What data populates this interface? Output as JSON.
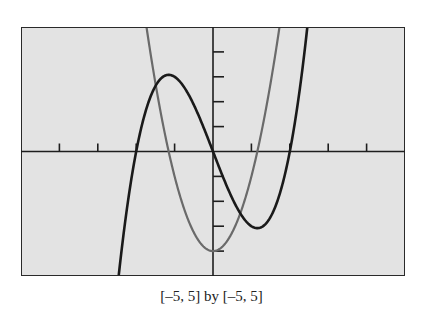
{
  "chart_data": {
    "type": "line",
    "title": "",
    "caption": "[–5, 5] by [–5, 5]",
    "xlabel": "",
    "ylabel": "",
    "xlim": [
      -5,
      5
    ],
    "ylim": [
      -5,
      5
    ],
    "xscl": 1,
    "yscl": 1,
    "grid": false,
    "legend": null,
    "background": "#e3e3e3",
    "series": [
      {
        "name": "f(x) = x^3 - 4x",
        "color": "#1a1a1a",
        "stroke_width": 2.6,
        "x": [
          -2.46,
          -2.25,
          -2,
          -1.75,
          -1.5,
          -1.155,
          -1,
          -0.75,
          -0.5,
          -0.25,
          0,
          0.25,
          0.5,
          0.75,
          1,
          1.155,
          1.5,
          1.75,
          2,
          2.25,
          2.46
        ],
        "values": [
          -5.05,
          -2.39,
          0,
          1.64,
          2.63,
          3.08,
          3,
          2.58,
          1.88,
          0.98,
          0,
          -0.98,
          -1.88,
          -2.58,
          -3,
          -3.08,
          -2.63,
          -1.64,
          0,
          2.39,
          5.05
        ]
      },
      {
        "name": "f'(x) = 3x^2 - 4",
        "color": "#6a6a6a",
        "stroke_width": 2.2,
        "x": [
          -1.732,
          -1.5,
          -1.25,
          -1.155,
          -1,
          -0.75,
          -0.5,
          -0.25,
          0,
          0.25,
          0.5,
          0.75,
          1,
          1.155,
          1.25,
          1.5,
          1.732
        ],
        "values": [
          5,
          2.75,
          0.69,
          0,
          -1,
          -2.31,
          -3.25,
          -3.81,
          -4,
          -3.81,
          -3.25,
          -2.31,
          -1,
          0,
          0.69,
          2.75,
          5
        ]
      }
    ],
    "key_points": {
      "cubic_roots": [
        -2,
        0,
        2
      ],
      "cubic_local_max": [
        -1.155,
        3.08
      ],
      "cubic_local_min": [
        1.155,
        -3.08
      ],
      "parabola_vertex": [
        0,
        -4
      ],
      "parabola_roots": [
        -1.155,
        1.155
      ]
    }
  },
  "caption": "[–5, 5] by [–5, 5]"
}
